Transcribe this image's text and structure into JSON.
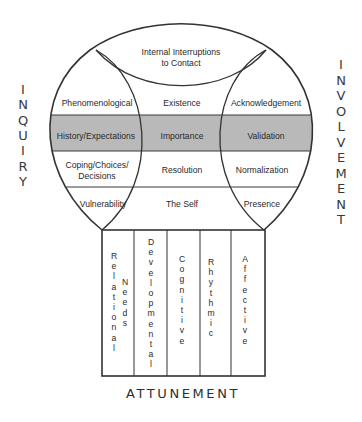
{
  "diagram": {
    "colors": {
      "line": "#333333",
      "band_fill": "#b8b8b8",
      "background": "#ffffff",
      "text": "#2a2a2a"
    },
    "side_labels": {
      "left": "INQUIRY",
      "right": "INVOLVEMENT",
      "bottom": "ATTUNEMENT"
    },
    "top_region": {
      "line1": "Internal Interruptions",
      "line2": "to Contact"
    },
    "rows": [
      {
        "left": "Phenomenological",
        "center": "Existence",
        "right": "Acknowledgement",
        "shaded": false
      },
      {
        "left": "History/Expectations",
        "center": "Importance",
        "right": "Validation",
        "shaded": true
      },
      {
        "left_line1": "Coping/Choices/",
        "left_line2": "Decisions",
        "center": "Resolution",
        "right": "Normalization",
        "shaded": false
      },
      {
        "left": "Vulnerability",
        "center": "The Self",
        "right": "Presence",
        "shaded": false
      }
    ],
    "columns": [
      {
        "label_a": "Relational",
        "label_b": "Needs"
      },
      {
        "label": "Developmental"
      },
      {
        "label": "Cognitive"
      },
      {
        "label": "Rhythmic"
      },
      {
        "label": "Affective"
      }
    ]
  }
}
